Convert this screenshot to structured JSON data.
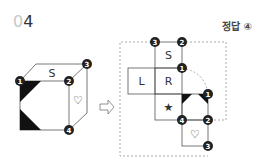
{
  "question": {
    "number_prefix": "0",
    "number_main": "4"
  },
  "answer": {
    "label": "정답",
    "value": "④"
  },
  "cube": {
    "top_face_label": "S",
    "right_face_label": "♡",
    "vertices": [
      {
        "id": "1",
        "label": "1"
      },
      {
        "id": "2",
        "label": "2"
      },
      {
        "id": "3",
        "label": "3"
      },
      {
        "id": "4",
        "label": "4"
      }
    ]
  },
  "arrow": {
    "glyph": "⇨"
  },
  "net": {
    "faces": {
      "top": "S",
      "left": "L",
      "center": "R",
      "star": "★",
      "heart": "♡"
    },
    "vertices": {
      "a": "3",
      "b": "2",
      "c": "1",
      "d": "1",
      "e": "4",
      "f": "2",
      "g": "3"
    }
  },
  "colors": {
    "line": "#555555",
    "fill_dark": "#111111",
    "dashed": "#888888"
  }
}
